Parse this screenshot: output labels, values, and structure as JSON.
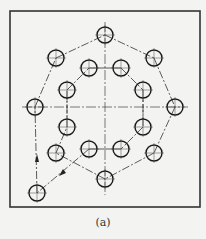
{
  "figure": {
    "caption": "(a)",
    "frame": {
      "x": 10,
      "y": 11,
      "w": 190,
      "h": 196
    },
    "center": {
      "x": 105,
      "y": 107
    },
    "hole_radius": 8,
    "start_hole": {
      "cx": 37,
      "cy": 193
    },
    "outer_holes": [
      {
        "cx": 105,
        "cy": 35
      },
      {
        "cx": 154,
        "cy": 58
      },
      {
        "cx": 175,
        "cy": 107
      },
      {
        "cx": 154,
        "cy": 153
      },
      {
        "cx": 105,
        "cy": 179
      },
      {
        "cx": 56,
        "cy": 153
      },
      {
        "cx": 35,
        "cy": 107
      },
      {
        "cx": 56,
        "cy": 58
      }
    ],
    "inner_holes": [
      {
        "cx": 89,
        "cy": 68
      },
      {
        "cx": 121,
        "cy": 68
      },
      {
        "cx": 143,
        "cy": 90
      },
      {
        "cx": 143,
        "cy": 127
      },
      {
        "cx": 121,
        "cy": 149
      },
      {
        "cx": 89,
        "cy": 149
      },
      {
        "cx": 67,
        "cy": 127
      },
      {
        "cx": 67,
        "cy": 90
      }
    ],
    "colors": {
      "line": "#222222",
      "background": "#f3f3f1"
    }
  }
}
